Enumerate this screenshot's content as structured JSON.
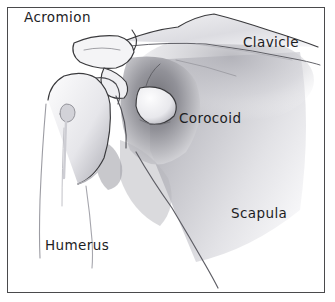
{
  "figure": {
    "medium": "pencil-sketch",
    "background_color": "#ffffff",
    "frame": {
      "name": "rectangular-border",
      "color": "#4a4a4c",
      "thickness_px": 1
    },
    "ink_color": "#1d1d1f"
  },
  "labels": {
    "acromion": "Acromion",
    "clavicle": "Clavicle",
    "corocoid": "Corocoid",
    "scapula": "Scapula",
    "humerus": "Humerus"
  },
  "structures": [
    {
      "name": "acromion",
      "description": "wedge-shaped process projecting to the left at top"
    },
    {
      "name": "clavicle",
      "description": "bone angling up and to the right along the top edge"
    },
    {
      "name": "corocoid",
      "description": "hook-shaped process in the centre of the joint"
    },
    {
      "name": "scapula",
      "description": "large shaded blade filling the right side"
    },
    {
      "name": "humerus",
      "description": "upper arm bone with rounded head at the left"
    }
  ],
  "shading": {
    "dark_tone": "#6f6f74",
    "mid_tone": "#9a9aa0",
    "light_tone": "#c7c7cc",
    "faint_tone": "#e2e2e6"
  }
}
